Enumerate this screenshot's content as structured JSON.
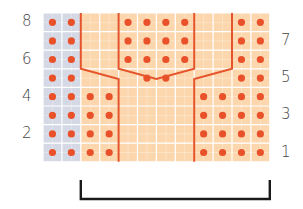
{
  "diagram": {
    "type": "knitting-chart",
    "columns": 12,
    "rows": 8,
    "grid": {
      "left": 43,
      "top": 13,
      "cell_w": 18.9,
      "cell_h": 18.6
    },
    "colors": {
      "contrast_cell": "#d5d9e5",
      "main_cell": "#fcd7ae",
      "gridline": "#ffffff",
      "dot": "#e9512a",
      "cable_line": "#e5542b",
      "bracket": "#1a1a1a",
      "label": "#444444"
    },
    "contrast_columns": [
      0,
      1
    ],
    "dots": {
      "8": [
        0,
        1,
        4,
        5,
        6,
        7,
        10,
        11
      ],
      "7": [
        0,
        1,
        4,
        5,
        6,
        7,
        10,
        11
      ],
      "6": [
        0,
        1,
        4,
        5,
        6,
        7,
        10,
        11
      ],
      "5": [
        0,
        1,
        5,
        6,
        10,
        11
      ],
      "4": [
        0,
        1,
        2,
        3,
        8,
        9,
        10,
        11
      ],
      "3": [
        0,
        1,
        2,
        3,
        8,
        9,
        10,
        11
      ],
      "2": [
        0,
        1,
        2,
        3,
        8,
        9,
        10,
        11
      ],
      "1": [
        0,
        1,
        2,
        3,
        8,
        9,
        10,
        11
      ]
    },
    "left_row_labels": [
      {
        "text": "8",
        "row": 8
      },
      {
        "text": "6",
        "row": 6
      },
      {
        "text": "4",
        "row": 4
      },
      {
        "text": "2",
        "row": 2
      }
    ],
    "right_row_labels": [
      {
        "text": "7",
        "row": 7
      },
      {
        "text": "5",
        "row": 5
      },
      {
        "text": "3",
        "row": 3
      },
      {
        "text": "1",
        "row": 1
      }
    ],
    "repeat_bracket": {
      "from_col": 2,
      "to_col": 12
    }
  }
}
